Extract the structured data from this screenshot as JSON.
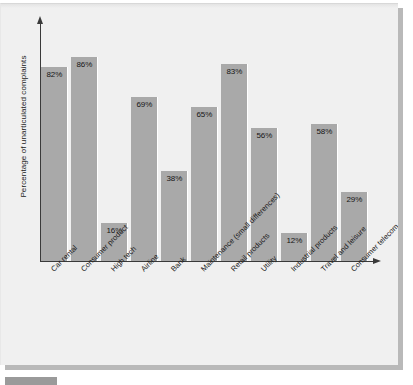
{
  "chart_data": {
    "type": "bar",
    "title": "",
    "xlabel": "",
    "ylabel": "Percentage of unarticulated complaints",
    "ylim": [
      0,
      100
    ],
    "grid": false,
    "legend": "none",
    "value_suffix": "%",
    "bar_color": "#a9a9a9",
    "axis_color": "#3a3a3a",
    "panel_color": "#f0f0f0",
    "categories": [
      "Car rental",
      "Consumer product",
      "High tech",
      "Airline",
      "Bank",
      "Maintenance (small differences)",
      "Retail products",
      "Utility",
      "Industrial products",
      "Travel and leisure",
      "Consumer telecom"
    ],
    "values": [
      82,
      86,
      16,
      69,
      38,
      65,
      83,
      56,
      12,
      58,
      29
    ],
    "value_labels": [
      "82%",
      "86%",
      "16%",
      "69%",
      "38%",
      "65%",
      "83%",
      "56%",
      "12%",
      "58%",
      "29%"
    ]
  },
  "caption": {
    "tag": "",
    "text": ""
  }
}
